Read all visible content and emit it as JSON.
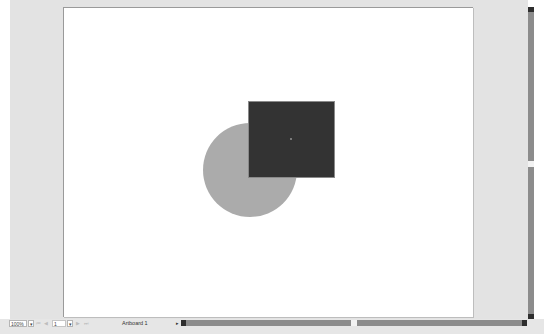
{
  "canvas": {
    "background": "#e3e3e3",
    "artboard": {
      "name": "Artboard 1",
      "background": "#ffffff"
    },
    "shapes": [
      {
        "type": "ellipse",
        "name": "circle",
        "fill": "#ababab"
      },
      {
        "type": "rectangle",
        "name": "square",
        "fill": "#333333",
        "selected": true
      }
    ]
  },
  "statusbar": {
    "zoom_value": "100%",
    "zoom_dropdown_icon": "▾",
    "first_icon": "⏮",
    "prev_icon": "◀",
    "artboard_number": "1",
    "artboard_dropdown_icon": "▾",
    "next_icon": "▶",
    "last_icon": "⏭",
    "artboard_label": "Artboard 1",
    "status_dropdown_icon": "▸"
  }
}
